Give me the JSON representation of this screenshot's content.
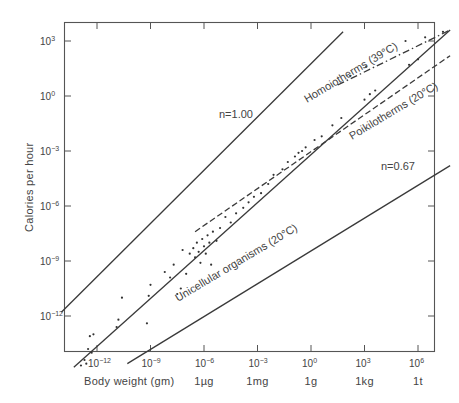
{
  "chart_data": {
    "type": "scatter",
    "title": "",
    "xlabel": "Body weight (gm)",
    "ylabel": "Calories per hour",
    "xscale": "log10",
    "yscale": "log10",
    "xlim_exp": [
      -14,
      8
    ],
    "ylim_exp": [
      -15.4,
      4.2
    ],
    "grid": false,
    "x_ticks": [
      {
        "exp": "-12",
        "unit": ""
      },
      {
        "exp": "-9",
        "unit": ""
      },
      {
        "exp": "-6",
        "unit": "1µg"
      },
      {
        "exp": "-3",
        "unit": "1mg"
      },
      {
        "exp": "0",
        "unit": "1g"
      },
      {
        "exp": "3",
        "unit": "1kg"
      },
      {
        "exp": "6",
        "unit": "1t"
      }
    ],
    "y_ticks": [
      {
        "exp": "3"
      },
      {
        "exp": "0"
      },
      {
        "exp": "-3"
      },
      {
        "exp": "-6"
      },
      {
        "exp": "-9"
      },
      {
        "exp": "-12"
      }
    ],
    "series": [
      {
        "name": "n=1.00",
        "style": "solid",
        "slope": 1.0,
        "points_log": [
          [
            -14,
            -11.8
          ],
          [
            1.8,
            3.5
          ]
        ]
      },
      {
        "name": "Homoiotherms (39°C)",
        "style": "dash-dot",
        "slope": 0.75,
        "points_log": [
          [
            1.5,
            0.6
          ],
          [
            7.8,
            3.6
          ]
        ]
      },
      {
        "name": "Poikilotherms (20°C)",
        "style": "dashed",
        "slope": 0.75,
        "points_log": [
          [
            -6.5,
            -7.4
          ],
          [
            7.8,
            2.2
          ]
        ]
      },
      {
        "name": "Unicellular organisms (20°C)",
        "style": "solid",
        "slope": 0.75,
        "points_log": [
          [
            -13.3,
            -14.8
          ],
          [
            7.8,
            3.6
          ]
        ]
      },
      {
        "name": "n=0.67",
        "style": "solid",
        "slope": 0.67,
        "points_log": [
          [
            -10.3,
            -14.6
          ],
          [
            7.8,
            -3.8
          ]
        ]
      }
    ],
    "annotations": [
      "n=1.00",
      "Homoiotherms (39°C)",
      "Poikilotherms (20°C)",
      "Unicellular organisms (20°C)",
      "n=0.67"
    ],
    "scatter_points_log": [
      [
        -12.9,
        -14.7
      ],
      [
        -12.7,
        -14.4
      ],
      [
        -12.6,
        -14.6
      ],
      [
        -12.5,
        -13.8
      ],
      [
        -12.3,
        -14.0
      ],
      [
        -12.2,
        -13.0
      ],
      [
        -12.4,
        -13.1
      ],
      [
        -10.9,
        -12.6
      ],
      [
        -10.8,
        -12.2
      ],
      [
        -10.6,
        -11.0
      ],
      [
        -9.2,
        -12.4
      ],
      [
        -9.1,
        -10.9
      ],
      [
        -9.0,
        -10.3
      ],
      [
        -8.2,
        -9.6
      ],
      [
        -7.9,
        -9.9
      ],
      [
        -7.7,
        -9.2
      ],
      [
        -7.5,
        -10.8
      ],
      [
        -7.3,
        -10.5
      ],
      [
        -7.2,
        -8.4
      ],
      [
        -7.0,
        -9.7
      ],
      [
        -6.8,
        -8.6
      ],
      [
        -6.6,
        -8.3
      ],
      [
        -6.5,
        -8.8
      ],
      [
        -6.4,
        -8.0
      ],
      [
        -6.3,
        -8.5
      ],
      [
        -6.2,
        -9.1
      ],
      [
        -6.1,
        -7.8
      ],
      [
        -6.0,
        -8.2
      ],
      [
        -5.9,
        -8.6
      ],
      [
        -5.8,
        -7.6
      ],
      [
        -5.7,
        -8.0
      ],
      [
        -5.6,
        -9.2
      ],
      [
        -5.5,
        -7.4
      ],
      [
        -5.3,
        -7.9
      ],
      [
        -5.1,
        -7.2
      ],
      [
        -4.8,
        -6.6
      ],
      [
        -4.5,
        -6.9
      ],
      [
        -4.2,
        -6.4
      ],
      [
        -3.8,
        -6.1
      ],
      [
        -3.5,
        -5.8
      ],
      [
        -3.2,
        -5.5
      ],
      [
        -2.8,
        -5.3
      ],
      [
        -2.4,
        -4.8
      ],
      [
        -2.1,
        -4.3
      ],
      [
        -1.6,
        -4.0
      ],
      [
        -1.3,
        -3.6
      ],
      [
        -0.9,
        -3.3
      ],
      [
        -0.7,
        -3.1
      ],
      [
        -0.5,
        -3.0
      ],
      [
        -0.3,
        -2.8
      ],
      [
        0.2,
        -2.4
      ],
      [
        0.6,
        -2.2
      ],
      [
        1.2,
        -1.6
      ],
      [
        1.7,
        -1.2
      ],
      [
        3.0,
        -0.2
      ],
      [
        3.3,
        0.1
      ],
      [
        3.6,
        0.3
      ],
      [
        5.5,
        1.7
      ],
      [
        6.0,
        2.0
      ],
      [
        2.2,
        1.1
      ],
      [
        3.1,
        1.6
      ],
      [
        5.3,
        3.0
      ],
      [
        6.4,
        3.2
      ],
      [
        7.4,
        3.5
      ]
    ]
  }
}
